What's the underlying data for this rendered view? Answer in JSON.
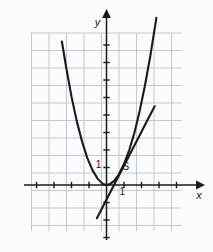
{
  "figure": {
    "background_color": "#fbfbfb",
    "width": 213,
    "height": 252
  },
  "chart_data": {
    "type": "line",
    "title": "",
    "xlabel": "x",
    "ylabel": "y",
    "grid": true,
    "legend": null,
    "axis_color": "#1a1a1a",
    "grid_color": "#b9c4cf",
    "curve_color": "#1a1a1a",
    "xlim": [
      -4.3,
      4.3
    ],
    "ylim": [
      -3.0,
      8.7
    ],
    "xticks": [
      -4,
      -3,
      -2,
      -1,
      1,
      2,
      3,
      4
    ],
    "yticks": [
      -3,
      -2,
      -1,
      1,
      2,
      3,
      4,
      5,
      6,
      7,
      8
    ],
    "tick_labels": [
      {
        "name": "y-axis-one",
        "text": "1",
        "x": -0.45,
        "y": 0.95
      },
      {
        "name": "x-axis-one",
        "text": "1",
        "x": 0.9,
        "y": -0.55
      }
    ],
    "annotations": [
      {
        "name": "point-s",
        "text": "S",
        "x": 1.1,
        "y": 0.85
      }
    ],
    "series": [
      {
        "name": "parabola",
        "label": "parabola",
        "type": "curve",
        "color": "#1a1a1a",
        "width": 2.1,
        "x": [
          -2.55,
          -2.3,
          -2.0,
          -1.7,
          -1.4,
          -1.1,
          -0.8,
          -0.5,
          -0.2,
          0.0,
          0.2,
          0.45,
          0.7,
          1.0,
          1.3,
          1.6,
          1.9,
          2.2,
          2.5,
          2.85
        ],
        "y": [
          8.2,
          6.7,
          5.05,
          3.65,
          2.5,
          1.55,
          0.85,
          0.35,
          0.05,
          0.0,
          0.05,
          0.25,
          0.6,
          1.2,
          2.0,
          3.0,
          4.25,
          5.7,
          7.35,
          9.55
        ]
      },
      {
        "name": "tangent-line",
        "label": "tangent",
        "type": "line",
        "color": "#1a1a1a",
        "width": 2.1,
        "x": [
          -0.55,
          2.75
        ],
        "y": [
          -1.9,
          4.5
        ]
      }
    ]
  },
  "axes": {
    "x_arrow": true,
    "y_arrow": true,
    "x_label": "x",
    "y_label": "y"
  }
}
